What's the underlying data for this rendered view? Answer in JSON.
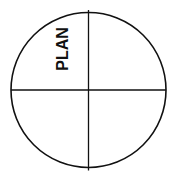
{
  "diagram": {
    "type": "quadrant-circle",
    "labels": [
      {
        "text": "PLAN",
        "quadrant": "top-left",
        "orientation": "vertical"
      }
    ],
    "line_color": "#111111",
    "background": "#ffffff"
  }
}
